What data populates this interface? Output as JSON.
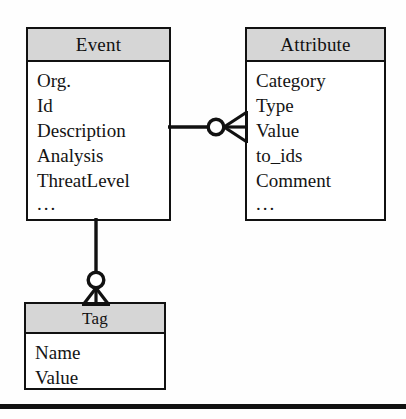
{
  "diagram": {
    "type": "entity-relationship",
    "notation": "crow's foot",
    "background_color": "#fefefe",
    "line_color": "#111111",
    "header_fill_color": "#d6d6d6",
    "entities": [
      {
        "id": "event",
        "title": "Event",
        "fields": [
          "Org.",
          "Id",
          "Description",
          "Analysis",
          "ThreatLevel"
        ],
        "more_indicator": "..."
      },
      {
        "id": "attribute",
        "title": "Attribute",
        "fields": [
          "Category",
          "Type",
          "Value",
          "to_ids",
          "Comment"
        ],
        "more_indicator": "..."
      },
      {
        "id": "tag",
        "title": "Tag",
        "fields": [
          "Name",
          "Value"
        ],
        "more_indicator": ""
      }
    ],
    "relationships": [
      {
        "id": "event-attribute",
        "from": "Event",
        "to": "Attribute",
        "from_cardinality": "one",
        "to_cardinality": "zero or many",
        "orientation": "horizontal"
      },
      {
        "id": "event-tag",
        "from": "Event",
        "to": "Tag",
        "from_cardinality": "one",
        "to_cardinality": "zero or many",
        "orientation": "vertical"
      }
    ]
  }
}
